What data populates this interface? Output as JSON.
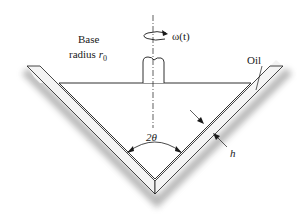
{
  "diagram": {
    "type": "conical-bearing-schematic",
    "labels": {
      "base_line1": "Base",
      "base_line2": "radius ",
      "base_var": "r",
      "base_sub": "0",
      "omega": "ω(t)",
      "oil": "Oil",
      "angle": "2θ",
      "gap": "h"
    },
    "colors": {
      "stroke": "#1a1a1a",
      "wall_fill": "#f2f2f2",
      "shadow": "#9a9a9a",
      "background": "#ffffff"
    }
  }
}
